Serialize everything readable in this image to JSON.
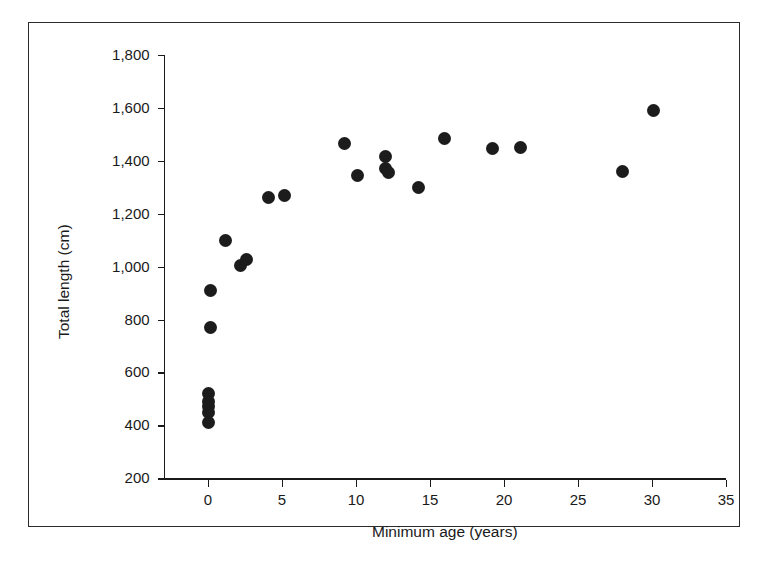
{
  "chart_data": {
    "type": "scatter",
    "title": "",
    "xlabel": "Minimum age (years)",
    "ylabel": "Total length (cm)",
    "xlim": [
      -3,
      35
    ],
    "ylim": [
      200,
      1800
    ],
    "xticks": [
      0,
      5,
      10,
      15,
      20,
      25,
      30,
      35
    ],
    "xtick_labels": [
      "0",
      "5",
      "10",
      "15",
      "20",
      "25",
      "30",
      "35"
    ],
    "yticks": [
      200,
      400,
      600,
      800,
      1000,
      1200,
      1400,
      1600,
      1800
    ],
    "ytick_labels": [
      "200",
      "400",
      "600",
      "800",
      "1,000",
      "1,200",
      "1,400",
      "1,600",
      "1,800"
    ],
    "grid": false,
    "legend": null,
    "marker": "filled-circle",
    "marker_color": "#1c1c1c",
    "marker_size_px": 13,
    "points": [
      {
        "x": 0.0,
        "y": 410
      },
      {
        "x": 0.0,
        "y": 450
      },
      {
        "x": 0.0,
        "y": 470
      },
      {
        "x": 0.0,
        "y": 490
      },
      {
        "x": 0.0,
        "y": 520
      },
      {
        "x": 0.2,
        "y": 770
      },
      {
        "x": 0.2,
        "y": 910
      },
      {
        "x": 1.2,
        "y": 1100
      },
      {
        "x": 2.2,
        "y": 1005
      },
      {
        "x": 2.6,
        "y": 1025
      },
      {
        "x": 4.1,
        "y": 1260
      },
      {
        "x": 5.2,
        "y": 1270
      },
      {
        "x": 9.2,
        "y": 1465
      },
      {
        "x": 10.1,
        "y": 1345
      },
      {
        "x": 12.0,
        "y": 1415
      },
      {
        "x": 12.0,
        "y": 1370
      },
      {
        "x": 12.2,
        "y": 1355
      },
      {
        "x": 14.2,
        "y": 1300
      },
      {
        "x": 16.0,
        "y": 1485
      },
      {
        "x": 19.2,
        "y": 1445
      },
      {
        "x": 21.1,
        "y": 1450
      },
      {
        "x": 28.0,
        "y": 1360
      },
      {
        "x": 30.1,
        "y": 1590
      }
    ]
  },
  "figure": {
    "frame_color": "#2b2b2b",
    "axis_color": "#1a1a1a",
    "background": "#ffffff"
  }
}
